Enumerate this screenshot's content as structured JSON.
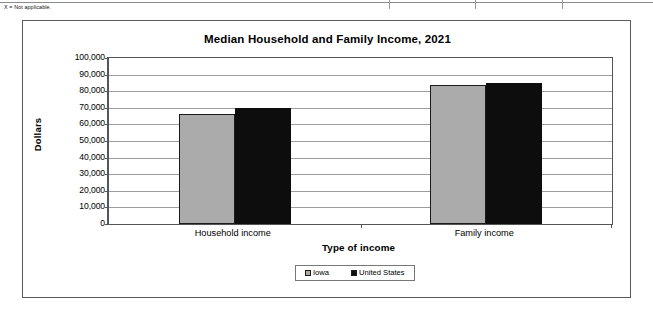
{
  "footnote": "X = Not applicable.",
  "chart_data": {
    "type": "bar",
    "title": "Median Household and Family Income, 2021",
    "xlabel": "Type of income",
    "ylabel": "Dollars",
    "categories": [
      "Household income",
      "Family income"
    ],
    "series": [
      {
        "name": "Iowa",
        "color": "#ababab",
        "values": [
          66000,
          84000
        ]
      },
      {
        "name": "United States",
        "color": "#0d0d0d",
        "values": [
          70000,
          85000
        ]
      }
    ],
    "ylim": [
      0,
      100000
    ],
    "ytick_labels": [
      "100,000",
      "90,000",
      "80,000",
      "70,000",
      "60,000",
      "50,000",
      "40,000",
      "30,000",
      "20,000",
      "10,000",
      "0"
    ],
    "ytick_values": [
      100000,
      90000,
      80000,
      70000,
      60000,
      50000,
      40000,
      30000,
      20000,
      10000,
      0
    ],
    "grid": true,
    "legend_position": "bottom"
  }
}
